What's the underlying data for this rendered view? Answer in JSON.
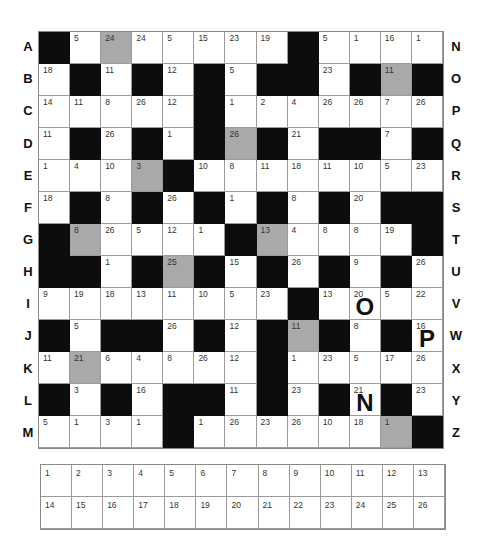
{
  "puzzle": {
    "type": "codeword",
    "rows": 13,
    "cols": 13,
    "colors": {
      "black": "#0d0d0d",
      "gray": "#a9a9a9",
      "white": "#ffffff"
    },
    "row_labels_left": [
      "A",
      "B",
      "C",
      "D",
      "E",
      "F",
      "G",
      "H",
      "I",
      "J",
      "K",
      "L",
      "M"
    ],
    "row_labels_right": [
      "N",
      "O",
      "P",
      "Q",
      "R",
      "S",
      "T",
      "U",
      "V",
      "W",
      "X",
      "Y",
      "Z"
    ],
    "grid": [
      [
        {
          "t": "b"
        },
        {
          "n": "5"
        },
        {
          "n": "24",
          "g": 1
        },
        {
          "n": "24"
        },
        {
          "n": "5"
        },
        {
          "n": "15"
        },
        {
          "n": "23"
        },
        {
          "n": "19"
        },
        {
          "t": "b"
        },
        {
          "n": "5"
        },
        {
          "n": "1"
        },
        {
          "n": "16"
        },
        {
          "n": "1"
        }
      ],
      [
        {
          "n": "18"
        },
        {
          "t": "b"
        },
        {
          "n": "11"
        },
        {
          "t": "b"
        },
        {
          "n": "12"
        },
        {
          "t": "b"
        },
        {
          "n": "5"
        },
        {
          "t": "b"
        },
        {
          "t": "b"
        },
        {
          "n": "23"
        },
        {
          "t": "b"
        },
        {
          "n": "11",
          "g": 1
        },
        {
          "t": "b"
        }
      ],
      [
        {
          "n": "14"
        },
        {
          "n": "11"
        },
        {
          "n": "8"
        },
        {
          "n": "26"
        },
        {
          "n": "12"
        },
        {
          "t": "b"
        },
        {
          "n": "1"
        },
        {
          "n": "2"
        },
        {
          "n": "4"
        },
        {
          "n": "26"
        },
        {
          "n": "26"
        },
        {
          "n": "7"
        },
        {
          "n": "26"
        }
      ],
      [
        {
          "n": "11"
        },
        {
          "t": "b"
        },
        {
          "n": "26"
        },
        {
          "t": "b"
        },
        {
          "n": "1"
        },
        {
          "t": "b"
        },
        {
          "n": "26",
          "g": 1
        },
        {
          "t": "b"
        },
        {
          "n": "21"
        },
        {
          "t": "b"
        },
        {
          "t": "b"
        },
        {
          "n": "7"
        },
        {
          "t": "b"
        }
      ],
      [
        {
          "n": "1"
        },
        {
          "n": "4"
        },
        {
          "n": "10"
        },
        {
          "n": "3",
          "g": 1
        },
        {
          "t": "b"
        },
        {
          "n": "10"
        },
        {
          "n": "8"
        },
        {
          "n": "11"
        },
        {
          "n": "18"
        },
        {
          "n": "11"
        },
        {
          "n": "10"
        },
        {
          "n": "5"
        },
        {
          "n": "23"
        }
      ],
      [
        {
          "n": "18"
        },
        {
          "t": "b"
        },
        {
          "n": "8"
        },
        {
          "t": "b"
        },
        {
          "n": "26"
        },
        {
          "t": "b"
        },
        {
          "n": "1"
        },
        {
          "t": "b"
        },
        {
          "n": "8"
        },
        {
          "t": "b"
        },
        {
          "n": "20"
        },
        {
          "t": "b"
        },
        {
          "t": "b"
        }
      ],
      [
        {
          "t": "b"
        },
        {
          "n": "8",
          "g": 1
        },
        {
          "n": "26"
        },
        {
          "n": "5"
        },
        {
          "n": "12"
        },
        {
          "n": "1"
        },
        {
          "t": "b"
        },
        {
          "n": "13",
          "g": 1
        },
        {
          "n": "4"
        },
        {
          "n": "8"
        },
        {
          "n": "8"
        },
        {
          "n": "19"
        },
        {
          "t": "b"
        }
      ],
      [
        {
          "t": "b"
        },
        {
          "t": "b"
        },
        {
          "n": "1"
        },
        {
          "t": "b"
        },
        {
          "n": "25",
          "g": 1
        },
        {
          "t": "b"
        },
        {
          "n": "15"
        },
        {
          "t": "b"
        },
        {
          "n": "26"
        },
        {
          "t": "b"
        },
        {
          "n": "9"
        },
        {
          "t": "b"
        },
        {
          "n": "26"
        }
      ],
      [
        {
          "n": "9"
        },
        {
          "n": "19"
        },
        {
          "n": "18"
        },
        {
          "n": "13"
        },
        {
          "n": "11"
        },
        {
          "n": "10"
        },
        {
          "n": "5"
        },
        {
          "n": "23"
        },
        {
          "t": "b"
        },
        {
          "n": "13"
        },
        {
          "n": "20",
          "l": "O"
        },
        {
          "n": "5"
        },
        {
          "n": "22"
        }
      ],
      [
        {
          "t": "b"
        },
        {
          "n": "5"
        },
        {
          "t": "b"
        },
        {
          "t": "b"
        },
        {
          "n": "26"
        },
        {
          "t": "b"
        },
        {
          "n": "12"
        },
        {
          "t": "b"
        },
        {
          "n": "11",
          "g": 1
        },
        {
          "t": "b"
        },
        {
          "n": "8"
        },
        {
          "t": "b"
        },
        {
          "n": "16",
          "l": "P"
        }
      ],
      [
        {
          "n": "11"
        },
        {
          "n": "21",
          "g": 1
        },
        {
          "n": "6"
        },
        {
          "n": "4"
        },
        {
          "n": "8"
        },
        {
          "n": "26"
        },
        {
          "n": "12"
        },
        {
          "t": "b"
        },
        {
          "n": "1"
        },
        {
          "n": "23"
        },
        {
          "n": "5"
        },
        {
          "n": "17"
        },
        {
          "n": "26"
        }
      ],
      [
        {
          "t": "b"
        },
        {
          "n": "3"
        },
        {
          "t": "b"
        },
        {
          "n": "16"
        },
        {
          "t": "b"
        },
        {
          "t": "b"
        },
        {
          "n": "11"
        },
        {
          "t": "b"
        },
        {
          "n": "23"
        },
        {
          "t": "b"
        },
        {
          "n": "21",
          "l": "N"
        },
        {
          "t": "b"
        },
        {
          "n": "23"
        }
      ],
      [
        {
          "n": "5"
        },
        {
          "n": "1"
        },
        {
          "n": "3"
        },
        {
          "n": "1"
        },
        {
          "t": "b"
        },
        {
          "n": "1"
        },
        {
          "n": "26"
        },
        {
          "n": "23"
        },
        {
          "n": "26"
        },
        {
          "n": "10"
        },
        {
          "n": "18"
        },
        {
          "n": "1",
          "g": 1
        },
        {
          "t": "b"
        }
      ]
    ],
    "given_letters": [
      {
        "number": "20",
        "letter": "O"
      },
      {
        "number": "16",
        "letter": "P"
      },
      {
        "number": "21",
        "letter": "N"
      }
    ],
    "key": [
      "1",
      "2",
      "3",
      "4",
      "5",
      "6",
      "7",
      "8",
      "9",
      "10",
      "11",
      "12",
      "13",
      "14",
      "15",
      "16",
      "17",
      "18",
      "19",
      "20",
      "21",
      "22",
      "23",
      "24",
      "25",
      "26"
    ]
  }
}
